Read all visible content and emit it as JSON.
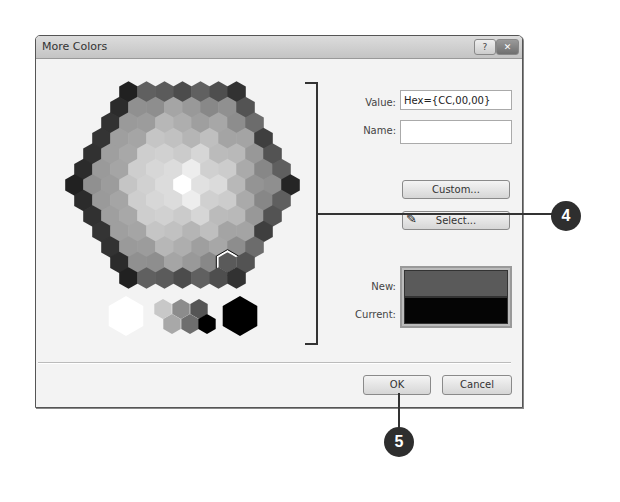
{
  "dialog": {
    "title": "More Colors",
    "help_button": "?",
    "close_button": "✕"
  },
  "fields": {
    "value_label": "Value:",
    "value": "Hex={CC,00,00}",
    "name_label": "Name:",
    "name_value": ""
  },
  "buttons": {
    "custom": "Custom...",
    "select": "Select...",
    "ok": "OK",
    "cancel": "Cancel"
  },
  "preview": {
    "new_label": "New:",
    "current_label": "Current:",
    "new_color": "#5a5a5a",
    "current_color": "#050505"
  },
  "callouts": {
    "step4": "4",
    "step5": "5"
  },
  "palette": {
    "row_counts": [
      7,
      8,
      9,
      10,
      11,
      12,
      13,
      12,
      11,
      10,
      9,
      8,
      7
    ],
    "selected": {
      "row": 11,
      "index": 6
    },
    "grayscale": [
      "#ffffff",
      "#c8c8c8",
      "#a8a8a8",
      "#8c8c8c",
      "#6e6e6e",
      "#555555",
      "#3a3a3a",
      "#000000"
    ]
  }
}
